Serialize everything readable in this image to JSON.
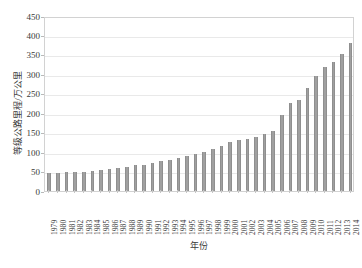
{
  "chart_data": {
    "type": "bar",
    "title": "",
    "xlabel": "年份",
    "ylabel": "等级公路里程/万公里",
    "ylim": [
      0,
      450
    ],
    "ytick_step": 50,
    "yticks": [
      0,
      50,
      100,
      150,
      200,
      250,
      300,
      350,
      400,
      450
    ],
    "grid": true,
    "legend": false,
    "bar_color": "#a0a0a0",
    "categories": [
      "1979",
      "1980",
      "1981",
      "1982",
      "1983",
      "1984",
      "1985",
      "1986",
      "1987",
      "1988",
      "1989",
      "1990",
      "1991",
      "1992",
      "1993",
      "1994",
      "1995",
      "1996",
      "1997",
      "1998",
      "1999",
      "2000",
      "2001",
      "2002",
      "2003",
      "2004",
      "2005",
      "2006",
      "2007",
      "2008",
      "2009",
      "2010",
      "2011",
      "2012",
      "2013",
      "2014"
    ],
    "values": [
      46,
      47,
      48,
      49,
      50,
      51,
      53,
      56,
      59,
      63,
      66,
      68,
      72,
      76,
      80,
      84,
      89,
      95,
      101,
      108,
      115,
      127,
      130,
      133,
      139,
      146,
      154,
      196,
      226,
      234,
      266,
      296,
      318,
      331,
      352,
      380
    ],
    "series": [
      {
        "name": "等级公路里程",
        "values": [
          46,
          47,
          48,
          49,
          50,
          51,
          53,
          56,
          59,
          63,
          66,
          68,
          72,
          76,
          80,
          84,
          89,
          95,
          101,
          108,
          115,
          127,
          130,
          133,
          139,
          146,
          154,
          196,
          226,
          234,
          266,
          296,
          318,
          331,
          352,
          380
        ]
      }
    ]
  }
}
